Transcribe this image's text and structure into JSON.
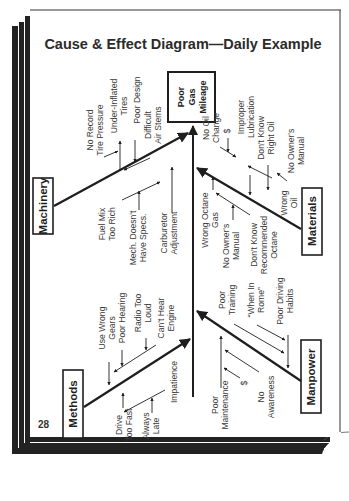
{
  "page": {
    "title": "Cause & Effect Diagram—Daily Example",
    "page_number": "28"
  },
  "colors": {
    "ink": "#1e1e1e",
    "paper": "#ffffff",
    "frame": "#222222"
  },
  "diagram": {
    "type": "fishbone",
    "orientation": "rotated-90-ccw",
    "effect": {
      "lines": [
        "Poor",
        "Gas",
        "Mileage"
      ]
    },
    "categories": [
      {
        "name": "Machinery",
        "causes": [
          {
            "label": [
              "No Record",
              "Tire Pressure"
            ]
          },
          {
            "label": [
              "Under-Inflated",
              "Tires"
            ]
          },
          {
            "label": [
              "Poor Design"
            ]
          },
          {
            "label": [
              "Difficult",
              "Air Stems"
            ]
          },
          {
            "label": [
              "Fuel Mix",
              "Too Rich"
            ]
          },
          {
            "label": [
              "Mech. Doesn't",
              "Have Specs."
            ]
          },
          {
            "label": [
              "Carburetor",
              "Adjustment"
            ]
          }
        ]
      },
      {
        "name": "Materials",
        "causes": [
          {
            "label": [
              "No Oil",
              "Change"
            ]
          },
          {
            "label": [
              "$"
            ]
          },
          {
            "label": [
              "Improper",
              "Lubrication"
            ]
          },
          {
            "label": [
              "Don't Know",
              "Right Oil"
            ]
          },
          {
            "label": [
              "No Owner's",
              "Manual"
            ]
          },
          {
            "label": [
              "Wrong",
              "Oil"
            ]
          },
          {
            "label": [
              "Wrong Octane",
              "Gas"
            ]
          },
          {
            "label": [
              "No Owner's",
              "Manual"
            ]
          },
          {
            "label": [
              "Don't Know",
              "Recommended",
              "Octane"
            ]
          }
        ]
      },
      {
        "name": "Methods",
        "causes": [
          {
            "label": [
              "Use Wrong",
              "Gears"
            ]
          },
          {
            "label": [
              "Poor Hearing"
            ]
          },
          {
            "label": [
              "Radio Too",
              "Loud"
            ]
          },
          {
            "label": [
              "Can't Hear",
              "Engine"
            ]
          },
          {
            "label": [
              "Drive",
              "Too Fast"
            ]
          },
          {
            "label": [
              "Always",
              "Late"
            ]
          },
          {
            "label": [
              "Impatience"
            ]
          }
        ]
      },
      {
        "name": "Manpower",
        "causes": [
          {
            "label": [
              "Poor",
              "Training"
            ]
          },
          {
            "label": [
              "“When In",
              "Rome”"
            ]
          },
          {
            "label": [
              "Poor Driving",
              "Habits"
            ]
          },
          {
            "label": [
              "Poor",
              "Maintenance"
            ]
          },
          {
            "label": [
              "$"
            ]
          },
          {
            "label": [
              "No",
              "Awareness"
            ]
          }
        ]
      }
    ]
  }
}
